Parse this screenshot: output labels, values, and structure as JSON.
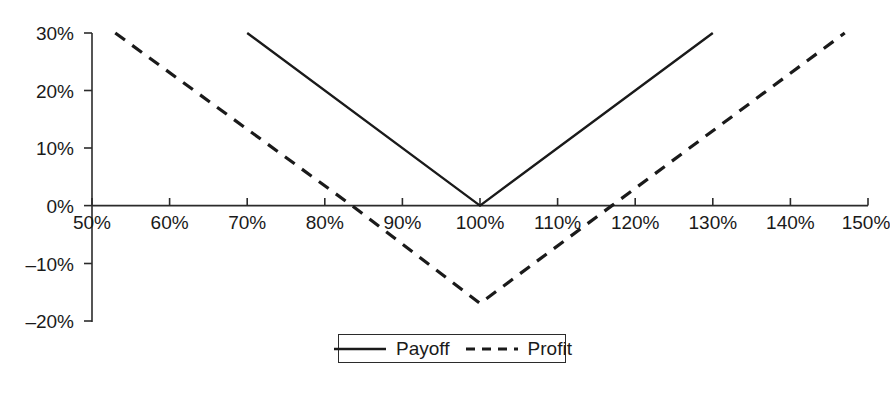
{
  "chart_data": {
    "type": "line",
    "title": "",
    "subtitle": "",
    "xlabel": "",
    "ylabel": "",
    "xlim": [
      50,
      150
    ],
    "ylim": [
      -20,
      30
    ],
    "grid": false,
    "legend_position": "bottom",
    "x_ticks": [
      "50%",
      "60%",
      "70%",
      "80%",
      "90%",
      "100%",
      "110%",
      "120%",
      "130%",
      "140%",
      "150%"
    ],
    "x_tick_values": [
      50,
      60,
      70,
      80,
      90,
      100,
      110,
      120,
      130,
      140,
      150
    ],
    "y_ticks": [
      "30%",
      "20%",
      "10%",
      "0%",
      "–10%",
      "–20%"
    ],
    "y_tick_values": [
      30,
      20,
      10,
      0,
      -10,
      -20
    ],
    "series": [
      {
        "name": "Payoff",
        "style": "solid",
        "color": "#1a1a1a",
        "x": [
          70,
          100,
          130
        ],
        "values": [
          30,
          0,
          30
        ]
      },
      {
        "name": "Profit",
        "style": "dashed",
        "color": "#1a1a1a",
        "x": [
          53,
          83.5,
          100,
          117,
          147
        ],
        "values": [
          30,
          0,
          -17,
          0,
          30
        ]
      }
    ]
  },
  "legend": {
    "items": [
      {
        "label": "Payoff",
        "style": "solid"
      },
      {
        "label": "Profit",
        "style": "dashed"
      }
    ]
  },
  "axes": {
    "y_tick_0": "30%",
    "y_tick_1": "20%",
    "y_tick_2": "10%",
    "y_tick_3": "0%",
    "y_tick_4": "–10%",
    "y_tick_5": "–20%",
    "x_tick_0": "50%",
    "x_tick_1": "60%",
    "x_tick_2": "70%",
    "x_tick_3": "80%",
    "x_tick_4": "90%",
    "x_tick_5": "100%",
    "x_tick_6": "110%",
    "x_tick_7": "120%",
    "x_tick_8": "130%",
    "x_tick_9": "140%",
    "x_tick_10": "150%"
  }
}
